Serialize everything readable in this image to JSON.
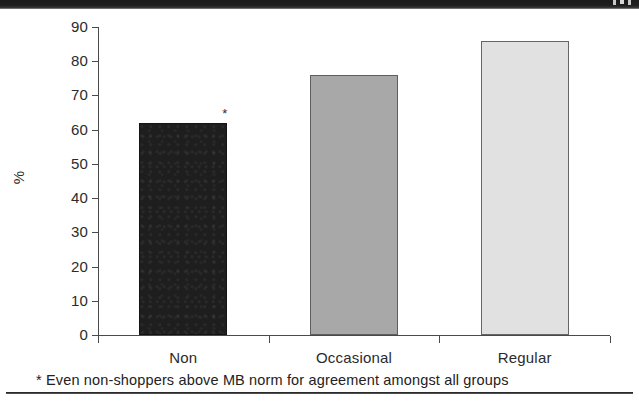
{
  "top_band": {
    "present": true,
    "glyph_fragments": [
      "p",
      "p"
    ],
    "color": "#1b1b1b"
  },
  "footnote": {
    "text": "* Even non-shoppers above MB norm for agreement amongst all groups"
  },
  "annotation": {
    "asterisk": "*"
  },
  "colors": {
    "bar_non": "#1e1e1e",
    "bar_occasional": "#a8a8a8",
    "bar_regular": "#e1e1e1",
    "axis": "#4a4a4a",
    "text": "#2b2b2b"
  },
  "chart_data": {
    "type": "bar",
    "title": "",
    "subtitle": "",
    "xlabel": "",
    "ylabel": "%",
    "categories": [
      "Non",
      "Occasional",
      "Regular"
    ],
    "values": [
      62,
      76,
      86
    ],
    "series": [
      {
        "name": "% agreement",
        "values": [
          62,
          76,
          86
        ],
        "colors": [
          "#1e1e1e",
          "#a8a8a8",
          "#e1e1e1"
        ]
      }
    ],
    "ylim": [
      0,
      90
    ],
    "ytick_step": 10,
    "yticks": [
      90,
      80,
      70,
      60,
      50,
      40,
      30,
      20,
      10,
      0
    ],
    "ytick_labels": [
      "90",
      "80",
      "70",
      "60",
      "50",
      "40",
      "30",
      "20",
      "10",
      "0"
    ],
    "grid": false,
    "legend": "none",
    "annotations": [
      {
        "text": "*",
        "category": "Non",
        "note": "* Even non-shoppers above MB norm for agreement amongst all groups"
      }
    ]
  }
}
